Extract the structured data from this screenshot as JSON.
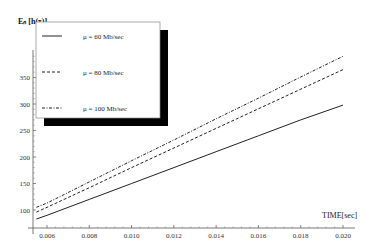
{
  "chart_data": {
    "type": "line",
    "title": "",
    "xlabel": "TIME[sec]",
    "ylabel": "E_n [h(τ)]",
    "ylabel_display": "Eₙ [h(τ)]",
    "xlim": [
      0.0054,
      0.0205
    ],
    "ylim": [
      66,
      395
    ],
    "x_ticks": [
      "0.006",
      "0.008",
      "0.010",
      "0.012",
      "0.014",
      "0.016",
      "0.018",
      "0.020"
    ],
    "y_ticks": [
      "100",
      "150",
      "200",
      "250",
      "300",
      "350"
    ],
    "grid": false,
    "legend_position": "upper-left, boxed with drop shadow",
    "x": [
      0.0055,
      0.006,
      0.008,
      0.01,
      0.012,
      0.014,
      0.016,
      0.018,
      0.02
    ],
    "series": [
      {
        "name": "μ = 60 Mb/sec",
        "style": "solid",
        "values": [
          83,
          90,
          120,
          150,
          180,
          210,
          240,
          270,
          298
        ]
      },
      {
        "name": "μ = 80 Mb/sec",
        "style": "dashed",
        "values": [
          96,
          105,
          142,
          180,
          217,
          254,
          291,
          328,
          365
        ]
      },
      {
        "name": "μ = 100 Mb/sec",
        "style": "dash-dot",
        "values": [
          105,
          113,
          153,
          193,
          232,
          272,
          311,
          351,
          390
        ]
      }
    ]
  },
  "legend": {
    "items": [
      {
        "label": "μ = 60 Mb/sec"
      },
      {
        "label": "μ = 80 Mb/sec"
      },
      {
        "label": "μ = 100 Mb/sec"
      }
    ]
  },
  "colors": {
    "line": "#222222",
    "shadow": "#000000",
    "axis": "#555555"
  }
}
